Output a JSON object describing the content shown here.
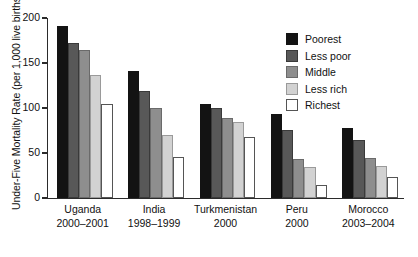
{
  "chart_data": {
    "type": "bar",
    "title": "",
    "xlabel": "",
    "ylabel": "Under-Five Mortality Rate (per 1,000 live births)",
    "ylim": [
      0,
      200
    ],
    "yticks": [
      0,
      50,
      100,
      150,
      200
    ],
    "ytick_labels": [
      "0",
      "50",
      "100",
      "150",
      "200"
    ],
    "grid": false,
    "legend_position": "upper right",
    "categories": [
      "Uganda\n2000–2001",
      "India\n1998–1999",
      "Turkmenistan\n2000",
      "Peru\n2000",
      "Morocco\n2003–2004"
    ],
    "category_lines": [
      {
        "country": "Uganda",
        "years": "2000–2001"
      },
      {
        "country": "India",
        "years": "1998–1999"
      },
      {
        "country": "Turkmenistan",
        "years": "2000"
      },
      {
        "country": "Peru",
        "years": "2000"
      },
      {
        "country": "Morocco",
        "years": "2003–2004"
      }
    ],
    "series": [
      {
        "name": "Poorest",
        "color": "#131313",
        "values": [
          191,
          141,
          105,
          93,
          78
        ]
      },
      {
        "name": "Less poor",
        "color": "#585858",
        "values": [
          172,
          119,
          100,
          76,
          65
        ]
      },
      {
        "name": "Middle",
        "color": "#8e8e8e",
        "values": [
          164,
          100,
          89,
          43,
          44
        ]
      },
      {
        "name": "Less rich",
        "color": "#d2d2d2",
        "values": [
          137,
          70,
          84,
          34,
          36
        ]
      },
      {
        "name": "Richest",
        "color": "#ffffff",
        "values": [
          105,
          46,
          68,
          14,
          23
        ]
      }
    ]
  }
}
